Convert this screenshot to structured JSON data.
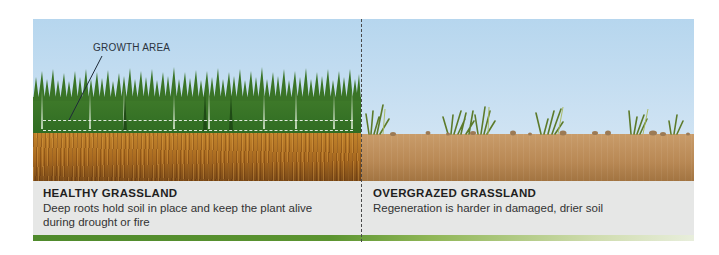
{
  "diagram": {
    "annotation": {
      "label": "GROWTH AREA"
    },
    "left_panel": {
      "title": "HEALTHY GRASSLAND",
      "description": "Deep roots hold soil in place and keep the plant alive during drought or fire",
      "grass_color": "#3f7a2a",
      "soil_color": "#a8691f"
    },
    "right_panel": {
      "title": "OVERGRAZED GRASSLAND",
      "description": "Regeneration is harder in damaged, drier soil",
      "soil_color": "#b88854"
    },
    "colors": {
      "sky": "#c4dcf0",
      "caption_background": "#e6e7e6",
      "footer_bar": "#5b9430"
    }
  }
}
